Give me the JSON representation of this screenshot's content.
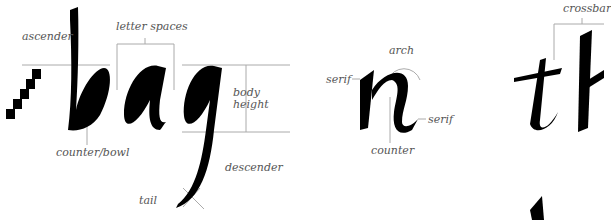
{
  "diagram": {
    "type": "calligraphy-letter-anatomy",
    "colors": {
      "ink": "#000000",
      "guide_line": "#aaaaaa",
      "label_text": "#555555",
      "background": "#ffffff"
    },
    "sections": [
      {
        "id": "bag",
        "word": "bag",
        "letters": [
          "b",
          "a",
          "g"
        ],
        "labels": {
          "ascender": "ascender",
          "letter_spaces": "letter spaces",
          "body_height": "body height",
          "body_height_line1": "body",
          "body_height_line2": "height",
          "counter_bowl": "counter/bowl",
          "descender": "descender",
          "tail": "tail"
        },
        "pen_width_marker": "nib-width ladder (5 squares)"
      },
      {
        "id": "n",
        "word": "n",
        "labels": {
          "arch": "arch",
          "serif_left": "serif",
          "serif_right": "serif",
          "counter": "counter"
        }
      },
      {
        "id": "th",
        "word": "th",
        "letters": [
          "t",
          "h"
        ],
        "labels": {
          "crossbar": "crossbar"
        }
      }
    ]
  }
}
